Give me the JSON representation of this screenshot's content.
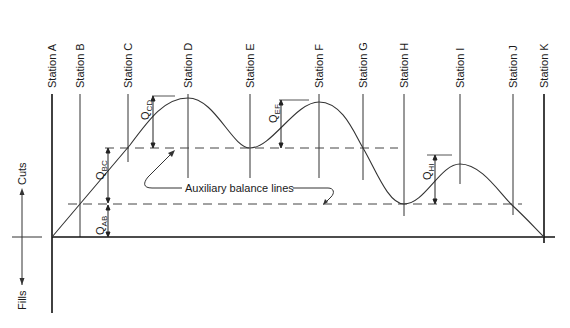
{
  "diagram": {
    "type": "mass-haul diagram",
    "stations": [
      {
        "id": "A",
        "label": "Station A",
        "x": 52
      },
      {
        "id": "B",
        "label": "Station B",
        "x": 80
      },
      {
        "id": "C",
        "label": "Station C",
        "x": 128
      },
      {
        "id": "D",
        "label": "Station D",
        "x": 188
      },
      {
        "id": "E",
        "label": "Station E",
        "x": 250
      },
      {
        "id": "F",
        "label": "Station F",
        "x": 319
      },
      {
        "id": "G",
        "label": "Station G",
        "x": 363
      },
      {
        "id": "H",
        "label": "Station H",
        "x": 404
      },
      {
        "id": "I",
        "label": "Station I",
        "x": 460
      },
      {
        "id": "J",
        "label": "Station J",
        "x": 513
      },
      {
        "id": "K",
        "label": "Station K",
        "x": 544
      }
    ],
    "axis": {
      "cuts_label": "Cuts",
      "fills_label": "Fills"
    },
    "quantities": [
      {
        "id": "QAB",
        "main": "Q",
        "sub": "AB"
      },
      {
        "id": "QBC",
        "main": "Q",
        "sub": "BC"
      },
      {
        "id": "QCD",
        "main": "Q",
        "sub": "CD"
      },
      {
        "id": "QEF",
        "main": "Q",
        "sub": "EF"
      },
      {
        "id": "QHI",
        "main": "Q",
        "sub": "HI"
      }
    ],
    "annotation": {
      "label": "Auxiliary balance lines"
    }
  }
}
